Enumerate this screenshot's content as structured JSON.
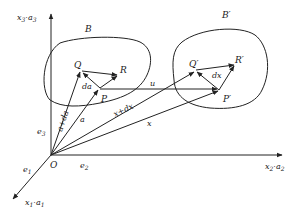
{
  "diagram": {
    "type": "continuum-deformation",
    "origin": "O",
    "axes": {
      "x3": {
        "label": "x",
        "sub": "3",
        "sep": "·",
        "label2": "a",
        "sub2": "3"
      },
      "x2": {
        "label": "x",
        "sub": "2",
        "sep": "·",
        "label2": "a",
        "sub2": "2"
      },
      "x1": {
        "label": "x",
        "sub": "1",
        "sep": "·",
        "label2": "a",
        "sub2": "1"
      }
    },
    "basis": {
      "e3": {
        "label": "e",
        "sub": "3"
      },
      "e2": {
        "label": "e",
        "sub": "2"
      },
      "e1": {
        "label": "e",
        "sub": "1"
      }
    },
    "regions": {
      "undeformed": "B",
      "deformed": "B′"
    },
    "points": {
      "Q": "Q",
      "R": "R",
      "P": "P",
      "Qp": "Q′",
      "Rp": "R′",
      "Pp": "P′"
    },
    "vectors": {
      "a": "a",
      "a_da": "a+da",
      "da": "da",
      "u": "u",
      "x": "x",
      "x_dx": "x+dx",
      "dx": "dx"
    }
  }
}
